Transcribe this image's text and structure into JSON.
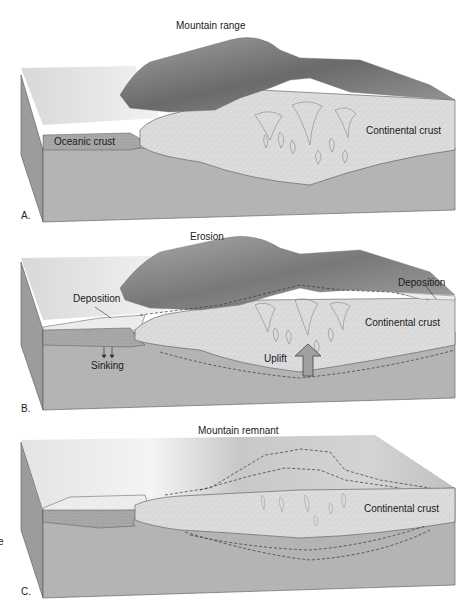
{
  "figure": {
    "panels": [
      {
        "letter": "A.",
        "title": "Mountain range",
        "labels": {
          "oceanic": "Oceanic crust",
          "continental": "Continental crust"
        }
      },
      {
        "letter": "B.",
        "title": "Erosion",
        "labels": {
          "deposition_left": "Deposition",
          "deposition_right": "Deposition",
          "continental": "Continental crust",
          "sinking": "Sinking",
          "uplift": "Uplift"
        }
      },
      {
        "letter": "C.",
        "title": "Mountain remnant",
        "labels": {
          "continental": "Continental crust"
        }
      }
    ],
    "stray_glyph": "e",
    "colors": {
      "mantle": "#b4b4b4",
      "mantle_side": "#9c9c9c",
      "continental": "#dcdcdc",
      "oceanic": "#a8a8a8",
      "surface": "#e6e6e6",
      "mountain_dark": "#6e6e6e",
      "sediment": "#ececec",
      "uplift_arrow": "#a0a0a0"
    }
  }
}
